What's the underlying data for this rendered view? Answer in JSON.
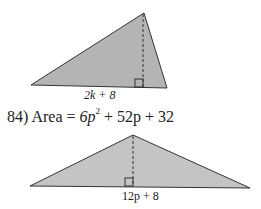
{
  "figure_top": {
    "base_label": "2k + 8",
    "shape": "triangle",
    "fill": "#b4b4b4",
    "height": "dashed"
  },
  "problem_84": {
    "number": "84)",
    "area_text": "Area = 6p² + 52p + 32",
    "area_prefix": "Area =",
    "terms": [
      "6p",
      "2",
      "+ 52p + 32"
    ],
    "base_label": "12p + 8",
    "fill": "#c4c4c4"
  }
}
